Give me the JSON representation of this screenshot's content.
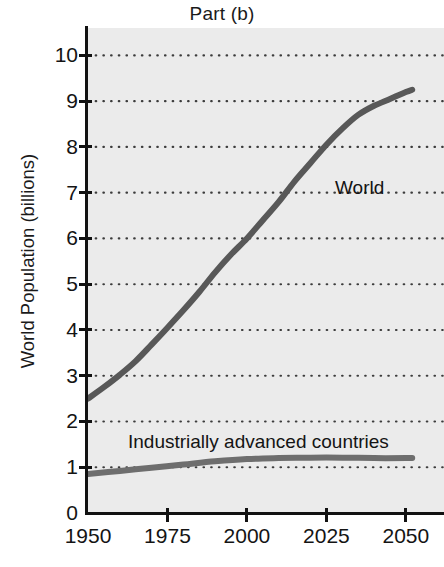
{
  "chart_data": {
    "type": "line",
    "title": "Part (b)",
    "xlabel": "",
    "ylabel": "World Population (billions)",
    "xlim": [
      1950,
      2062
    ],
    "ylim": [
      0,
      10.6
    ],
    "grid": true,
    "legend_position": "inline-annotation",
    "x_ticks": [
      "1950",
      "1975",
      "2000",
      "2025",
      "2050"
    ],
    "x_tick_values": [
      1950,
      1975,
      2000,
      2025,
      2050
    ],
    "y_ticks": [
      "10",
      "9",
      "8",
      "7",
      "6",
      "5",
      "4",
      "3",
      "2",
      "1",
      "0"
    ],
    "y_tick_values": [
      10,
      9,
      8,
      7,
      6,
      5,
      4,
      3,
      2,
      1,
      0
    ],
    "series": [
      {
        "name": "World",
        "color": "#585858",
        "x": [
          1950,
          1955,
          1960,
          1965,
          1970,
          1975,
          1980,
          1985,
          1990,
          1995,
          2000,
          2005,
          2010,
          2015,
          2020,
          2025,
          2030,
          2035,
          2040,
          2045,
          2050,
          2052
        ],
        "values": [
          2.5,
          2.75,
          3.02,
          3.32,
          3.68,
          4.05,
          4.43,
          4.83,
          5.26,
          5.65,
          6.0,
          6.4,
          6.8,
          7.25,
          7.65,
          8.05,
          8.4,
          8.7,
          8.9,
          9.05,
          9.2,
          9.25
        ]
      },
      {
        "name": "Industrially advanced countries",
        "color": "#6e6e6e",
        "x": [
          1950,
          1960,
          1970,
          1980,
          1990,
          2000,
          2010,
          2020,
          2030,
          2040,
          2050,
          2052
        ],
        "values": [
          0.85,
          0.92,
          0.99,
          1.06,
          1.13,
          1.18,
          1.2,
          1.21,
          1.21,
          1.2,
          1.2,
          1.2
        ]
      }
    ],
    "annotations": [
      {
        "text": "World",
        "x": 2027,
        "y": 7.35
      },
      {
        "text": "Industrially advanced countries",
        "x": 1963,
        "y": 1.85
      }
    ],
    "colors": {
      "plot_background": "#ebebeb",
      "page_background": "#ffffff",
      "axis": "#121212",
      "gridline": "#3c3c3c",
      "text": "#141414"
    }
  }
}
